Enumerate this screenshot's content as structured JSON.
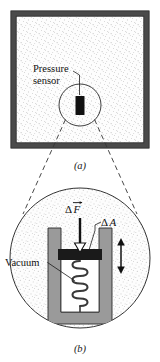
{
  "figure": {
    "caption_a": "(a)",
    "caption_b": "(b)",
    "panel_a": {
      "label_pressure": "Pressure",
      "label_sensor": "sensor",
      "fill_description": "stippled fluid",
      "border_color": "#4a4a4a",
      "fluid_color": "#fdfdfd",
      "stipple_color": "#8a8a8a",
      "sensor_color": "#111111"
    },
    "panel_b": {
      "label_delta_f_delta": "Δ",
      "label_delta_f_symbol": "F",
      "label_delta_a_delta": "Δ",
      "label_delta_a_symbol": "A",
      "label_vacuum": "Vacuum",
      "cylinder_color": "#9a9a9a",
      "piston_color": "#1a1a1a",
      "vacuum_color": "#ffffff",
      "spring_color": "#3a3a3a",
      "circle_outline_color": "#333333",
      "stipple_color": "#9a9a9a",
      "arrow_color": "#111111",
      "spring_coils": 6
    },
    "connector": {
      "style": "dashed",
      "color": "#333333",
      "description": "magnification leader lines"
    }
  }
}
